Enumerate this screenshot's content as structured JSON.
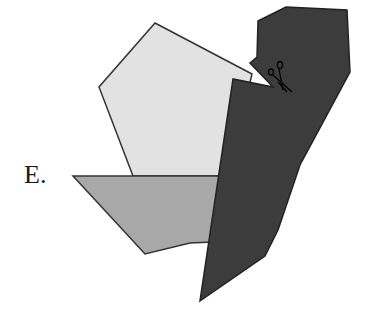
{
  "figure": {
    "option_label": "E.",
    "shapes": {
      "pentagon": {
        "fill": "#e2e2e2",
        "stroke": "#333333",
        "points": "155,23 252,74 228,176 133,176 99,87"
      },
      "trapezoid": {
        "fill": "#a8a8a8",
        "stroke": "#333333",
        "points": "73,176 230,176 213,242 190,243 145,254"
      },
      "dark_piece": {
        "fill": "#3c3c3c",
        "stroke": "#222222",
        "points": "258,21 286,7 347,10 350,72 300,165 278,230 265,256 200,301 233,79 273,87 250,63 257,57"
      }
    },
    "icon": "scissors-icon"
  }
}
